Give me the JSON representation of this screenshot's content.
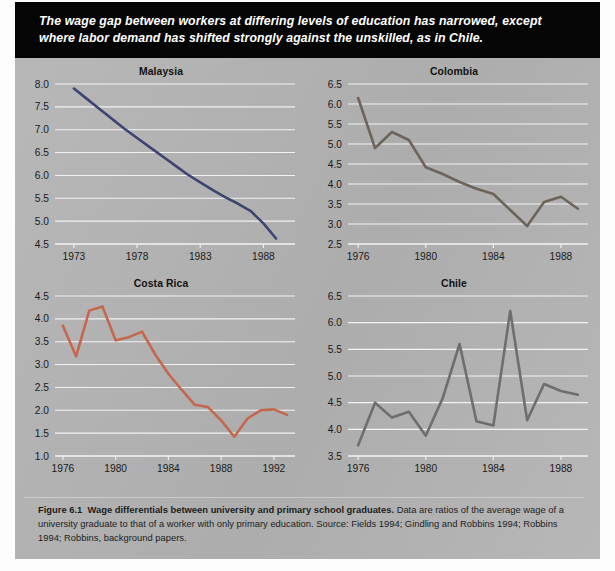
{
  "banner": {
    "text": "The wage gap between workers at differing levels of education has narrowed, except where labor demand has shifted strongly against the unskilled, as in Chile."
  },
  "caption": {
    "figure_label": "Figure 6.1",
    "title": "Wage differentials between university and primary school graduates.",
    "body": " Data are ratios of the average wage of a university graduate to that of a worker with only primary education. Source: Fields 1994; Gindling and Robbins 1994; Robbins 1994; Robbins, background papers."
  },
  "colors": {
    "page_background": "#b3b3b3",
    "banner_background": "#050505",
    "gridline": "#f2f2f2",
    "malaysia_line": "#3e4470",
    "colombia_line": "#6d645b",
    "costa_rica_line": "#c4674f",
    "chile_line": "#6e6e6e"
  },
  "chart_data": [
    {
      "type": "line",
      "title": "Malaysia",
      "xlabel": "",
      "ylabel": "",
      "xlim": [
        1971.5,
        1990.5
      ],
      "ylim": [
        4.5,
        8.0
      ],
      "grid": true,
      "legend": "none",
      "color": "#3e4470",
      "xticks": [
        "1973",
        "1978",
        "1983",
        "1988"
      ],
      "xtick_values": [
        1973,
        1978,
        1983,
        1988
      ],
      "yticks": [
        "4.5",
        "5.0",
        "5.5",
        "6.0",
        "6.5",
        "7.0",
        "7.5",
        "8.0"
      ],
      "ytick_values": [
        4.5,
        5.0,
        5.5,
        6.0,
        6.5,
        7.0,
        7.5,
        8.0
      ],
      "x": [
        1973,
        1974,
        1975,
        1976,
        1977,
        1978,
        1979,
        1980,
        1981,
        1982,
        1983,
        1984,
        1985,
        1986,
        1987,
        1988,
        1989
      ],
      "values": [
        7.9,
        7.68,
        7.46,
        7.24,
        7.02,
        6.82,
        6.62,
        6.42,
        6.22,
        6.02,
        5.85,
        5.68,
        5.52,
        5.38,
        5.22,
        4.95,
        4.62
      ]
    },
    {
      "type": "line",
      "title": "Colombia",
      "xlabel": "",
      "ylabel": "",
      "xlim": [
        1975.4,
        1989.6
      ],
      "ylim": [
        2.5,
        6.5
      ],
      "grid": true,
      "legend": "none",
      "color": "#6d645b",
      "xticks": [
        "1976",
        "1980",
        "1984",
        "1988"
      ],
      "xtick_values": [
        1976,
        1980,
        1984,
        1988
      ],
      "yticks": [
        "2.5",
        "3.0",
        "3.5",
        "4.0",
        "4.5",
        "5.0",
        "5.5",
        "6.0",
        "6.5"
      ],
      "ytick_values": [
        2.5,
        3.0,
        3.5,
        4.0,
        4.5,
        5.0,
        5.5,
        6.0,
        6.5
      ],
      "x": [
        1976,
        1977,
        1978,
        1979,
        1980,
        1981,
        1982,
        1983,
        1984,
        1985,
        1986,
        1987,
        1988,
        1989
      ],
      "values": [
        6.15,
        4.9,
        5.3,
        5.1,
        4.42,
        4.25,
        4.05,
        3.88,
        3.75,
        3.35,
        2.95,
        3.55,
        3.68,
        3.38
      ]
    },
    {
      "type": "line",
      "title": "Costa Rica",
      "xlabel": "",
      "ylabel": "",
      "xlim": [
        1975.4,
        1993.6
      ],
      "ylim": [
        1.0,
        4.5
      ],
      "grid": true,
      "legend": "none",
      "color": "#c4674f",
      "xticks": [
        "1976",
        "1980",
        "1984",
        "1988",
        "1992"
      ],
      "xtick_values": [
        1976,
        1980,
        1984,
        1988,
        1992
      ],
      "yticks": [
        "1.0",
        "1.5",
        "2.0",
        "2.5",
        "3.0",
        "3.5",
        "4.0",
        "4.5"
      ],
      "ytick_values": [
        1.0,
        1.5,
        2.0,
        2.5,
        3.0,
        3.5,
        4.0,
        4.5
      ],
      "x": [
        1976,
        1977,
        1978,
        1979,
        1980,
        1981,
        1982,
        1983,
        1984,
        1985,
        1986,
        1987,
        1988,
        1989,
        1990,
        1991,
        1992,
        1993
      ],
      "values": [
        3.85,
        3.18,
        4.18,
        4.27,
        3.53,
        3.6,
        3.72,
        3.22,
        2.8,
        2.45,
        2.12,
        2.07,
        1.78,
        1.42,
        1.82,
        2.0,
        2.02,
        1.9
      ]
    },
    {
      "type": "line",
      "title": "Chile",
      "xlabel": "",
      "ylabel": "",
      "xlim": [
        1975.4,
        1989.6
      ],
      "ylim": [
        3.5,
        6.5
      ],
      "grid": true,
      "legend": "none",
      "color": "#6e6e6e",
      "xticks": [
        "1976",
        "1980",
        "1984",
        "1988"
      ],
      "xtick_values": [
        1976,
        1980,
        1984,
        1988
      ],
      "yticks": [
        "3.5",
        "4.0",
        "4.5",
        "5.0",
        "5.5",
        "6.0",
        "6.5"
      ],
      "ytick_values": [
        3.5,
        4.0,
        4.5,
        5.0,
        5.5,
        6.0,
        6.5
      ],
      "x": [
        1976,
        1977,
        1978,
        1979,
        1980,
        1981,
        1982,
        1983,
        1984,
        1985,
        1986,
        1987,
        1988,
        1989
      ],
      "values": [
        3.7,
        4.5,
        4.22,
        4.33,
        3.88,
        4.58,
        5.6,
        4.15,
        4.07,
        6.22,
        4.17,
        4.85,
        4.72,
        4.65
      ]
    }
  ]
}
